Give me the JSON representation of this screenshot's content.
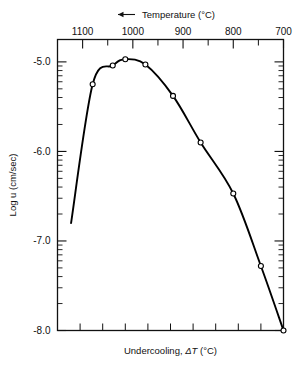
{
  "chart_data": {
    "type": "line",
    "title": "",
    "top_axis": {
      "label": "Temperature (°C)",
      "arrow": "left-arrow",
      "tick_labels": [
        "1100",
        "1000",
        "900",
        "800",
        "700"
      ],
      "tick_values": [
        1100,
        1000,
        900,
        800,
        700
      ],
      "direction": "decreasing-left-to-right",
      "range": [
        1150,
        700
      ],
      "minor_ticks_between": 1
    },
    "bottom_axis": {
      "label": "Undercooling, ΔT (°C)",
      "label_prefix": "Undercooling, ",
      "label_symbol": "ΔT",
      "label_units": " (°C)",
      "tick_labels": [],
      "n_ticks": 9
    },
    "ylabel": "Log u (cm/sec)",
    "ytick_labels": [
      "-5.0",
      "-6.0",
      "-7.0",
      "-8.0"
    ],
    "ytick_values": [
      -5.0,
      -6.0,
      -7.0,
      -8.0
    ],
    "ylim": [
      -8.0,
      -4.75
    ],
    "y_minor": "log-decade-subticks",
    "grid": false,
    "legend": null,
    "marker": "open-circle",
    "line_color": "#000000",
    "series": [
      {
        "name": "crystal growth rate",
        "x_label": "temperature_C",
        "x": [
          1123,
          1080,
          1040,
          1015,
          975,
          920,
          865,
          800,
          745,
          700
        ],
        "values": [
          -6.8,
          -5.25,
          -5.04,
          -4.97,
          -5.03,
          -5.38,
          -5.9,
          -6.47,
          -7.28,
          -8.0
        ],
        "marker_points_x": [
          1080,
          1040,
          1015,
          975,
          920,
          865,
          800,
          745,
          700
        ],
        "marker_points_y": [
          -5.25,
          -5.04,
          -4.97,
          -5.03,
          -5.38,
          -5.9,
          -6.47,
          -7.28,
          -8.0
        ]
      }
    ]
  },
  "colors": {
    "frame": "#111111",
    "curve": "#000000",
    "marker_fill": "#ffffff",
    "background": "#ffffff"
  }
}
